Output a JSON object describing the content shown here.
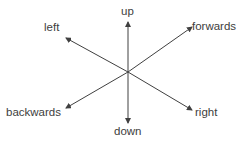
{
  "labels": {
    "up": "up",
    "down": "down",
    "left": "left",
    "right": "right",
    "forwards": "forwards",
    "backwards": "backwards"
  },
  "colors": {
    "line": "#404040",
    "text": "#404040"
  }
}
